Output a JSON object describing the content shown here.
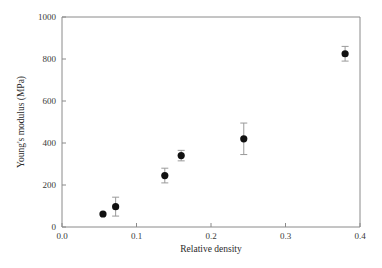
{
  "chart_data": {
    "type": "scatter",
    "title": "",
    "xlabel": "Relative density",
    "ylabel": "Young's modulus (MPa)",
    "xlim": [
      0.0,
      0.4
    ],
    "ylim": [
      0,
      1000
    ],
    "xticks": [
      "0.0",
      "0.1",
      "0.2",
      "0.3",
      "0.4"
    ],
    "xtick_values": [
      0.0,
      0.1,
      0.2,
      0.3,
      0.4
    ],
    "yticks": [
      "0",
      "200",
      "400",
      "600",
      "800",
      "1000"
    ],
    "ytick_values": [
      0,
      200,
      400,
      600,
      800,
      1000
    ],
    "grid": false,
    "legend": null,
    "marker_style": "filled-circle",
    "marker_color": "#111111",
    "errorbar_color": "#9a9a9a",
    "frame_color": "#8a8a8a",
    "background_color": "#ffffff",
    "x": [
      0.055,
      0.072,
      0.138,
      0.16,
      0.244,
      0.38
    ],
    "y": [
      62,
      97,
      245,
      340,
      420,
      825
    ],
    "yerr": [
      0,
      45,
      35,
      25,
      75,
      35
    ],
    "points": [
      {
        "x": 0.055,
        "y": 62,
        "yerr": 0
      },
      {
        "x": 0.072,
        "y": 97,
        "yerr": 45
      },
      {
        "x": 0.138,
        "y": 245,
        "yerr": 35
      },
      {
        "x": 0.16,
        "y": 340,
        "yerr": 25
      },
      {
        "x": 0.244,
        "y": 420,
        "yerr": 75
      },
      {
        "x": 0.38,
        "y": 825,
        "yerr": 35
      }
    ]
  },
  "axes": {
    "x_title": "Relative density",
    "y_title": "Young's modulus (MPa)"
  }
}
